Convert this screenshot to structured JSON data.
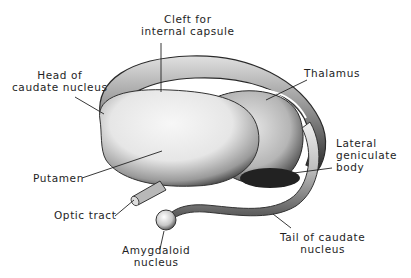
{
  "diagram": {
    "labels": {
      "cleft": {
        "line1": "Cleft for",
        "line2": "internal capsule"
      },
      "head_caudate": {
        "line1": "Head of",
        "line2": "caudate nucleus"
      },
      "thalamus": {
        "line1": "Thalamus"
      },
      "lateral_geniculate": {
        "line1": "Lateral",
        "line2": "geniculate",
        "line3": "body"
      },
      "putamen": {
        "line1": "Putamen"
      },
      "optic_tract": {
        "line1": "Optic tract"
      },
      "amygdaloid": {
        "line1": "Amygdaloid",
        "line2": "nucleus"
      },
      "tail_caudate": {
        "line1": "Tail of caudate",
        "line2": "nucleus"
      }
    },
    "colors": {
      "background": "#ffffff",
      "ink": "#1e1e1e",
      "shade_dark": "#2a2a2a",
      "shade_mid": "#8a8a8a",
      "highlight": "#f2f2f2"
    }
  }
}
